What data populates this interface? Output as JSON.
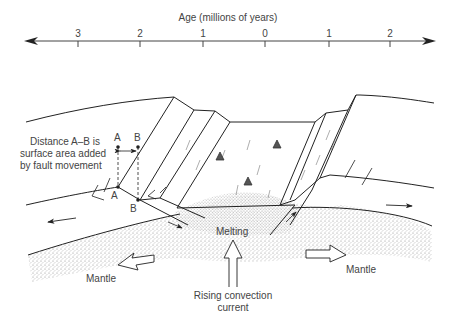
{
  "axis": {
    "title": "Age (millions of years)",
    "ticks": [
      {
        "label": "3",
        "x": 78
      },
      {
        "label": "2",
        "x": 140
      },
      {
        "label": "1",
        "x": 203
      },
      {
        "label": "0",
        "x": 265
      },
      {
        "label": "1",
        "x": 329
      },
      {
        "label": "2",
        "x": 390
      }
    ]
  },
  "labels": {
    "distance_note_line1": "Distance A–B is",
    "distance_note_line2": "surface area added",
    "distance_note_line3": "by fault movement",
    "point_a_top": "A",
    "point_b_top": "B",
    "point_a_bottom": "A",
    "point_b_bottom": "B",
    "melting": "Melting",
    "mantle_left": "Mantle",
    "mantle_right": "Mantle",
    "rising_line1": "Rising convection",
    "rising_line2": "current"
  },
  "colors": {
    "line": "#222222",
    "stipple": "#9a9a9a",
    "text": "#444444"
  }
}
